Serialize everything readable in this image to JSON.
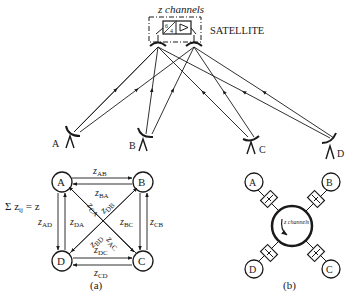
{
  "satellite": {
    "channels_label": "z channels",
    "label": "SATELLITE"
  },
  "earth_stations": [
    {
      "id": "A",
      "label": "A"
    },
    {
      "id": "B",
      "label": "B"
    },
    {
      "id": "C",
      "label": "C"
    },
    {
      "id": "D",
      "label": "D"
    }
  ],
  "panel_a": {
    "caption": "(a)",
    "sum_label": "Σ z",
    "sum_sub": "ij",
    "sum_rhs": " = z",
    "nodes": [
      "A",
      "B",
      "C",
      "D"
    ],
    "links": [
      {
        "z": "z",
        "sub": "AB"
      },
      {
        "z": "z",
        "sub": "BA"
      },
      {
        "z": "z",
        "sub": "CA"
      },
      {
        "z": "z",
        "sub": "DB"
      },
      {
        "z": "z",
        "sub": "AD"
      },
      {
        "z": "z",
        "sub": "DA"
      },
      {
        "z": "z",
        "sub": "BC"
      },
      {
        "z": "z",
        "sub": "CB"
      },
      {
        "z": "z",
        "sub": "BD"
      },
      {
        "z": "z",
        "sub": "AC"
      },
      {
        "z": "z",
        "sub": "DC"
      },
      {
        "z": "z",
        "sub": "CD"
      }
    ]
  },
  "panel_b": {
    "caption": "(b)",
    "nodes": [
      "A",
      "B",
      "C",
      "D"
    ],
    "pool_label": "z channels"
  }
}
